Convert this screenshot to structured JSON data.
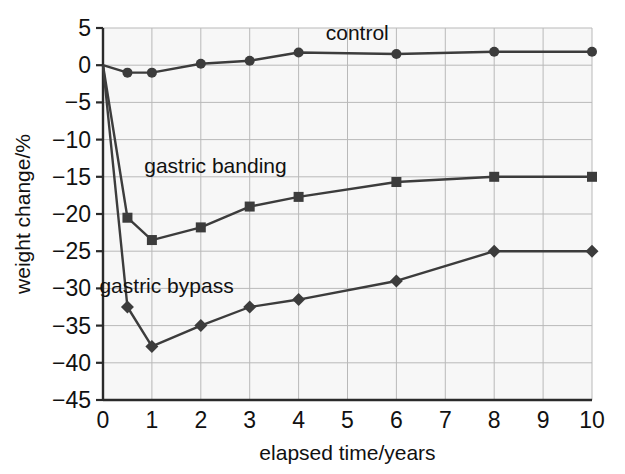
{
  "chart_data": {
    "type": "line",
    "title": "",
    "subtitle": "",
    "xlabel": "elapsed time/years",
    "ylabel": "weight change/%",
    "xlim": [
      0,
      10
    ],
    "ylim": [
      -45,
      5
    ],
    "xticks": [
      "0",
      "1",
      "2",
      "3",
      "4",
      "5",
      "6",
      "7",
      "8",
      "9",
      "10"
    ],
    "xtick_values": [
      0,
      1,
      2,
      3,
      4,
      5,
      6,
      7,
      8,
      9,
      10
    ],
    "yticks": [
      "5",
      "0",
      "−5",
      "−10",
      "−15",
      "−20",
      "−25",
      "−30",
      "−35",
      "−40",
      "−45"
    ],
    "ytick_values": [
      5,
      0,
      -5,
      -10,
      -15,
      -20,
      -25,
      -30,
      -35,
      -40,
      -45
    ],
    "grid": true,
    "grid_color": "#b9b9b9",
    "legend_position": "inline-annotations",
    "line_color": "#3c3c3c",
    "x": [
      0,
      0.5,
      1,
      2,
      3,
      4,
      6,
      8,
      10
    ],
    "series": [
      {
        "name": "control",
        "marker": "circle",
        "color": "#3c3c3c",
        "values": [
          0,
          -1,
          -1,
          0.2,
          0.6,
          1.7,
          1.5,
          1.8,
          1.8
        ],
        "label": "control",
        "label_x": 5.2,
        "label_y": 3.4
      },
      {
        "name": "gastric banding",
        "marker": "square",
        "color": "#3c3c3c",
        "values": [
          0,
          -20.5,
          -23.5,
          -21.8,
          -19,
          -17.7,
          -15.7,
          -15,
          -15
        ],
        "label": "gastric banding",
        "label_x": 2.3,
        "label_y": -14.5
      },
      {
        "name": "gastric bypass",
        "marker": "diamond",
        "color": "#3c3c3c",
        "values": [
          0,
          -32.5,
          -37.8,
          -35,
          -32.5,
          -31.5,
          -29,
          -25,
          -25
        ],
        "label": "gastric bypass",
        "label_x": 1.3,
        "label_y": -30.6
      }
    ]
  }
}
